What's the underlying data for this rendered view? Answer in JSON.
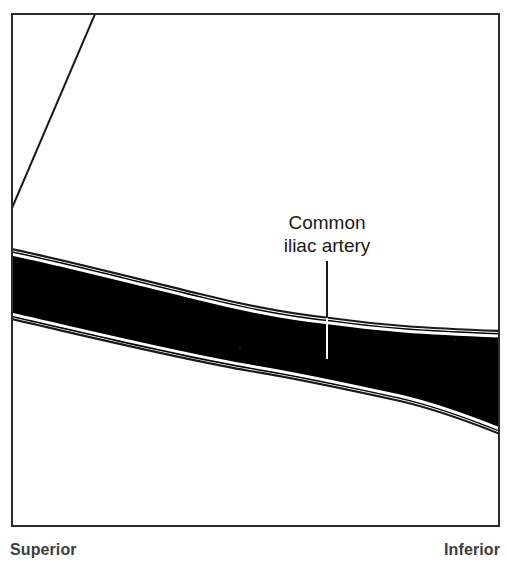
{
  "figure": {
    "name": "common-iliac-artery-angiogram",
    "frame": {
      "x": 11,
      "y": 13,
      "width": 489,
      "height": 514,
      "border_color": "#2b2b2b",
      "border_width": 2,
      "background_color": "#ffffff"
    },
    "annotation": {
      "line1": "Common",
      "line2": "iliac artery",
      "text_color": "#1a1a1a",
      "font_size_px": 19,
      "center_x": 327,
      "line1_y": 223,
      "line2_y": 246,
      "leader_line": {
        "x": 327,
        "y_top": 261,
        "y_bottom": 358,
        "color_outside_vessel": "#1a1a1a",
        "color_inside_vessel": "#ffffff"
      }
    },
    "vessel": {
      "label": "common iliac artery contrast column",
      "fill_color": "#000000",
      "outline_color": "#1a1a1a",
      "inner_gap_color": "#ffffff",
      "top_edge_points": "11,251 90,268 170,287 250,305 330,320 390,327 440,330 500,333",
      "bottom_edge_points": "11,317 90,334 170,352 250,369 330,383 390,396 440,406 500,432"
    },
    "catheter_line": {
      "label": "catheter-guidewire",
      "x1": 95,
      "y1": 14,
      "x2": 12,
      "y2": 208,
      "color": "#1a1a1a",
      "width": 2
    }
  },
  "orientation": {
    "left_label": "Superior",
    "right_label": "Inferior",
    "color": "#3d3d3d"
  }
}
